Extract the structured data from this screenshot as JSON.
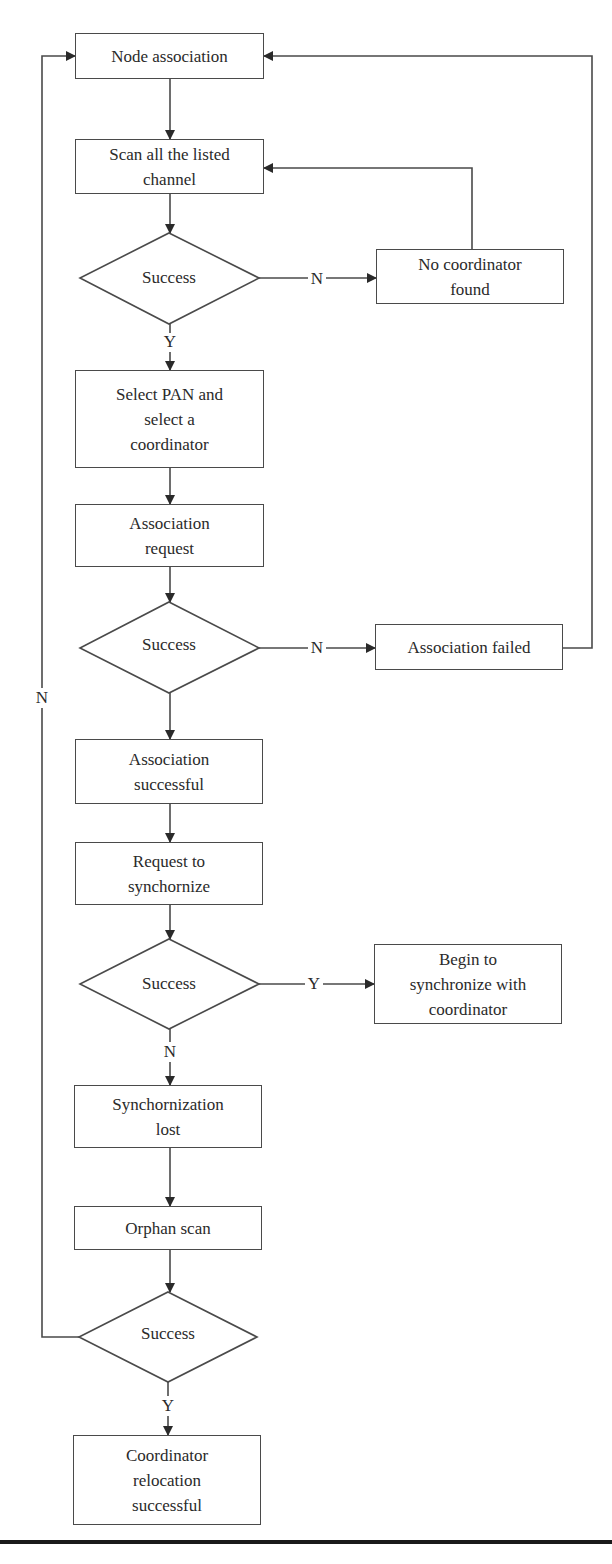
{
  "diagram": {
    "type": "flowchart",
    "nodes": {
      "node_association": "Node association",
      "scan_channels": "Scan all the listed\nchannel",
      "decision_scan": "Success",
      "no_coordinator": "No coordinator\nfound",
      "select_pan": "Select PAN and\nselect a\ncoordinator",
      "association_request": "Association\nrequest",
      "decision_association": "Success",
      "association_failed": "Association failed",
      "association_successful": "Association\nsuccessful",
      "request_sync": "Request to\nsynchornize",
      "decision_sync": "Success",
      "begin_sync": "Begin to\nsynchronize with\ncoordinator",
      "sync_lost": "Synchornization\nlost",
      "orphan_scan": "Orphan scan",
      "decision_orphan": "Success",
      "relocation_successful": "Coordinator\nrelocation\nsuccessful"
    },
    "edge_labels": {
      "scan_no": "N",
      "scan_yes": "Y",
      "association_no": "N",
      "sync_yes": "Y",
      "sync_no": "N",
      "orphan_no": "N",
      "orphan_yes": "Y"
    },
    "edges": [
      {
        "from": "node_association",
        "to": "scan_channels"
      },
      {
        "from": "scan_channels",
        "to": "decision_scan"
      },
      {
        "from": "decision_scan",
        "to": "no_coordinator",
        "label": "N"
      },
      {
        "from": "no_coordinator",
        "to": "scan_channels"
      },
      {
        "from": "decision_scan",
        "to": "select_pan",
        "label": "Y"
      },
      {
        "from": "select_pan",
        "to": "association_request"
      },
      {
        "from": "association_request",
        "to": "decision_association"
      },
      {
        "from": "decision_association",
        "to": "association_failed",
        "label": "N"
      },
      {
        "from": "association_failed",
        "to": "node_association"
      },
      {
        "from": "decision_association",
        "to": "association_successful"
      },
      {
        "from": "association_successful",
        "to": "request_sync"
      },
      {
        "from": "request_sync",
        "to": "decision_sync"
      },
      {
        "from": "decision_sync",
        "to": "begin_sync",
        "label": "Y"
      },
      {
        "from": "decision_sync",
        "to": "sync_lost",
        "label": "N"
      },
      {
        "from": "sync_lost",
        "to": "orphan_scan"
      },
      {
        "from": "orphan_scan",
        "to": "decision_orphan"
      },
      {
        "from": "decision_orphan",
        "to": "node_association",
        "label": "N"
      },
      {
        "from": "decision_orphan",
        "to": "relocation_successful",
        "label": "Y"
      }
    ]
  },
  "colors": {
    "stroke": "#4a4a4a",
    "text": "#2a2a2a",
    "rule": "#1a1a1a",
    "background": "#ffffff"
  }
}
